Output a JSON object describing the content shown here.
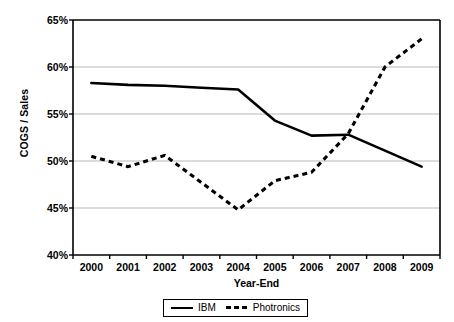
{
  "chart_data": {
    "type": "line",
    "title": "",
    "xlabel": "Year-End",
    "ylabel": "COGS / Sales",
    "x": [
      2000,
      2001,
      2002,
      2003,
      2004,
      2005,
      2006,
      2007,
      2008,
      2009
    ],
    "xtick_labels": [
      "2000",
      "2001",
      "2002",
      "2003",
      "2004",
      "2005",
      "2006",
      "2007",
      "2008",
      "2009"
    ],
    "ylim": [
      40,
      65
    ],
    "ytick_values": [
      40,
      45,
      50,
      55,
      60,
      65
    ],
    "ytick_labels": [
      "40%",
      "45%",
      "50%",
      "55%",
      "60%",
      "65%"
    ],
    "grid": "horizontal",
    "legend_position": "bottom",
    "series": [
      {
        "name": "IBM",
        "style": "solid",
        "color": "#000000",
        "values": [
          58.3,
          58.1,
          58.0,
          57.8,
          57.6,
          54.3,
          52.7,
          52.8,
          51.1,
          49.4
        ]
      },
      {
        "name": "Photronics",
        "style": "dashed",
        "color": "#000000",
        "values": [
          50.5,
          49.4,
          50.6,
          47.7,
          44.8,
          47.9,
          48.8,
          52.9,
          60.0,
          63.0
        ]
      }
    ]
  },
  "legend": {
    "items": [
      {
        "label": "IBM"
      },
      {
        "label": "Photronics"
      }
    ]
  }
}
